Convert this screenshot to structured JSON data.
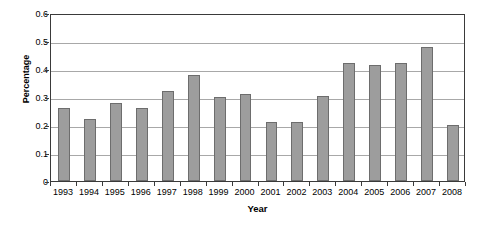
{
  "chart_data": {
    "type": "bar",
    "title": "",
    "xlabel": "Year",
    "ylabel": "Percentage",
    "categories": [
      "1993",
      "1994",
      "1995",
      "1996",
      "1997",
      "1998",
      "1999",
      "2000",
      "2001",
      "2002",
      "2003",
      "2004",
      "2005",
      "2006",
      "2007",
      "2008"
    ],
    "values": [
      0.26,
      0.22,
      0.28,
      0.26,
      0.32,
      0.38,
      0.3,
      0.31,
      0.21,
      0.21,
      0.305,
      0.42,
      0.415,
      0.42,
      0.48,
      0.2
    ],
    "ylim": [
      0,
      0.6
    ],
    "ytick_labels": [
      "0",
      "0.1",
      "0.2",
      "0.3",
      "0.4",
      "0.5",
      "0.6"
    ],
    "ytick_values": [
      0,
      0.1,
      0.2,
      0.3,
      0.4,
      0.5,
      0.6
    ],
    "grid": true,
    "legend": "none",
    "bar_color": "#9d9d9d",
    "bar_edge_color": "#6d6d6d",
    "grid_color": "#a8a8a8",
    "axis_color": "#3a3a3a"
  }
}
